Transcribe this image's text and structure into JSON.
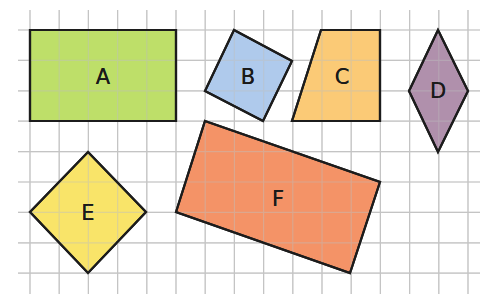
{
  "grid": {
    "x_lines": [
      30,
      59.2,
      88.4,
      117.6,
      146.8,
      176,
      205.2,
      234.4,
      263.6,
      292.8,
      322,
      351.2,
      380.4,
      409.6,
      438.8,
      468
    ],
    "y_lines": [
      30,
      60.4,
      90.8,
      121.2,
      151.6,
      182,
      212.4,
      242.8,
      273.2
    ],
    "x_extent": [
      18,
      480
    ],
    "y_extent": [
      10,
      294
    ],
    "line_color": "#c4c4c4"
  },
  "shapes": [
    {
      "label": "A",
      "name": "rectangle",
      "fill": "#b9dc5c",
      "points": "30,30 176,30 176,121 30,121",
      "label_x": 103,
      "label_y": 84
    },
    {
      "label": "B",
      "name": "square",
      "fill": "#a8c6ea",
      "points": "234,30 292,61 263,121 205,91",
      "label_x": 248,
      "label_y": 84
    },
    {
      "label": "C",
      "name": "trapezium",
      "fill": "#fbc66a",
      "points": "321,30 380,30 380,121 292,121",
      "label_x": 342,
      "label_y": 84
    },
    {
      "label": "D",
      "name": "rhombus",
      "fill": "#a987a5",
      "points": "438,30 468,91 438,152 409,91",
      "label_x": 438,
      "label_y": 98
    },
    {
      "label": "E",
      "name": "square-diamond",
      "fill": "#f8e25c",
      "points": "88,152 146,212 88,273 30,212",
      "label_x": 88,
      "label_y": 220
    },
    {
      "label": "F",
      "name": "rotated-rectangle",
      "fill": "#f38a5a",
      "points": "205,121 380,182 350,273 176,212",
      "label_x": 278,
      "label_y": 206
    }
  ]
}
